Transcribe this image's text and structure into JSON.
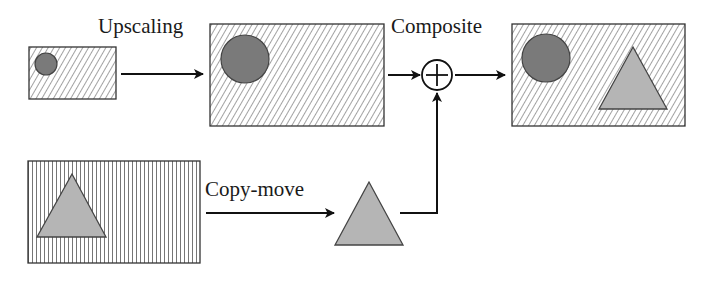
{
  "labels": {
    "upscaling": "Upscaling",
    "composite": "Composite",
    "copy_move": "Copy-move"
  },
  "operators": {
    "composite_symbol": "plus-circle"
  },
  "colors": {
    "circle_fill": "#7a7a7a",
    "triangle_fill": "#b5b5b5",
    "hatch": "#555555",
    "stroke": "#111111"
  },
  "nodes": [
    {
      "id": "small-image",
      "pattern": "diagonal-hatch",
      "contains": [
        "circle"
      ]
    },
    {
      "id": "upscaled-image",
      "pattern": "diagonal-hatch",
      "contains": [
        "circle"
      ]
    },
    {
      "id": "composite-result",
      "pattern": "diagonal-hatch",
      "contains": [
        "circle",
        "triangle"
      ]
    },
    {
      "id": "source-image",
      "pattern": "vertical-hatch",
      "contains": [
        "triangle"
      ]
    },
    {
      "id": "copied-triangle",
      "pattern": "none",
      "contains": [
        "triangle"
      ]
    }
  ],
  "edges": [
    {
      "from": "small-image",
      "to": "upscaled-image",
      "label": "Upscaling"
    },
    {
      "from": "upscaled-image",
      "to": "composite-operator",
      "label": ""
    },
    {
      "from": "composite-operator",
      "to": "composite-result",
      "label": "Composite"
    },
    {
      "from": "source-image",
      "to": "copied-triangle",
      "label": "Copy-move"
    },
    {
      "from": "copied-triangle",
      "to": "composite-operator",
      "label": ""
    }
  ]
}
